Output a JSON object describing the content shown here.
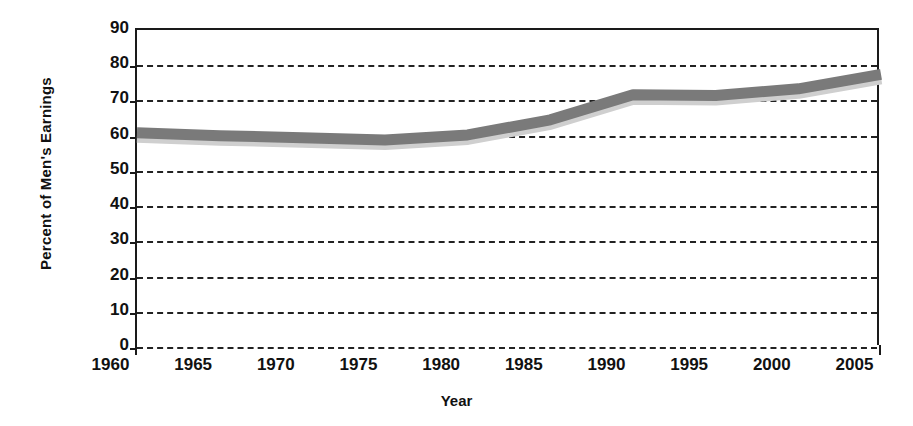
{
  "chart_data": {
    "type": "line",
    "title": "",
    "xlabel": "Year",
    "ylabel": "Percent of Men's Earnings",
    "xlim": [
      1960,
      2005
    ],
    "ylim": [
      0,
      90
    ],
    "grid": true,
    "legend": "none",
    "line_color": "#7a7a7a",
    "axis_color": "#1a1a1a",
    "x": [
      1960,
      1965,
      1970,
      1975,
      1980,
      1985,
      1990,
      1995,
      2000,
      2005
    ],
    "xtick_labels": [
      "1960",
      "1965",
      "1970",
      "1975",
      "1980",
      "1985",
      "1990",
      "1995",
      "2000",
      "2005"
    ],
    "ytick_labels": [
      "0",
      "10",
      "20",
      "30",
      "40",
      "50",
      "60",
      "70",
      "80",
      "90"
    ],
    "yticks": [
      0,
      10,
      20,
      30,
      40,
      50,
      60,
      70,
      80,
      90
    ],
    "series": [
      {
        "name": "Women's earnings as percent of men's",
        "values": [
          60.8,
          60.0,
          59.4,
          58.8,
          60.2,
          64.5,
          71.6,
          71.4,
          73.3,
          77.4
        ]
      }
    ]
  }
}
